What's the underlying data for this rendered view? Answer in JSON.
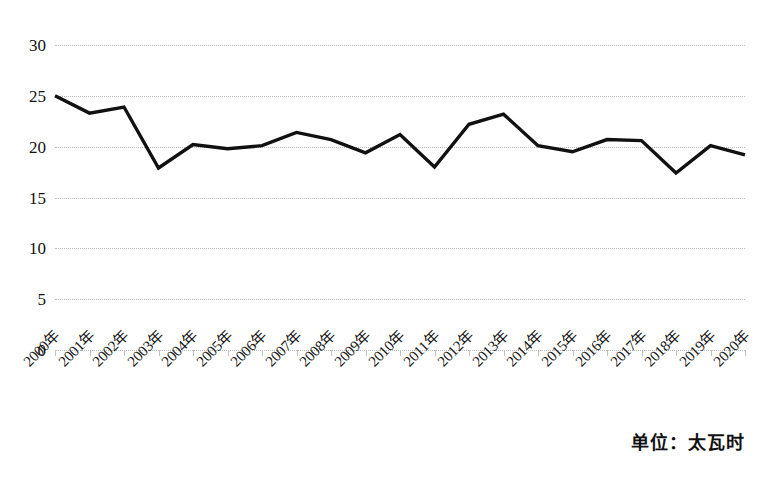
{
  "chart_data": {
    "type": "line",
    "title": "",
    "subtitle": "",
    "xlabel": "",
    "ylabel": "",
    "unit_note": "单位：太瓦时",
    "grid": true,
    "legend": "none",
    "ylim": [
      0,
      30
    ],
    "y_ticks": [
      0,
      5,
      10,
      15,
      20,
      25,
      30
    ],
    "y_tick_labels": [
      "0",
      "5",
      "10",
      "15",
      "20",
      "25",
      "30"
    ],
    "categories": [
      "2000年",
      "2001年",
      "2002年",
      "2003年",
      "2004年",
      "2005年",
      "2006年",
      "2007年",
      "2008年",
      "2009年",
      "2010年",
      "2011年",
      "2012年",
      "2013年",
      "2014年",
      "2015年",
      "2016年",
      "2017年",
      "2018年",
      "2019年",
      "2020年"
    ],
    "series": [
      {
        "name": "发电量",
        "color": "#111111",
        "values": [
          25.0,
          23.3,
          23.9,
          17.9,
          20.2,
          19.8,
          20.1,
          21.4,
          20.7,
          19.4,
          21.2,
          18.0,
          22.2,
          23.2,
          20.1,
          19.5,
          20.7,
          20.6,
          17.4,
          20.1,
          19.2
        ]
      }
    ]
  },
  "axis": {
    "y_label_0": "0",
    "y_label_5": "5",
    "y_label_10": "10",
    "y_label_15": "15",
    "y_label_20": "20",
    "y_label_25": "25",
    "y_label_30": "30"
  },
  "footer": {
    "unit_text": "单位：太瓦时"
  }
}
